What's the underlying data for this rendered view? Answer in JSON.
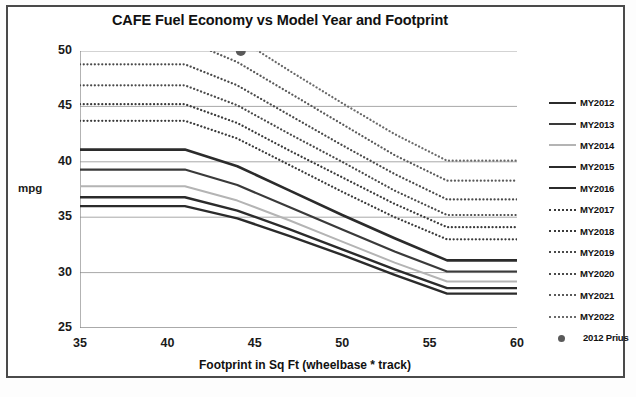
{
  "chart_data": {
    "type": "line",
    "title": "CAFE Fuel Economy vs Model Year and Footprint",
    "xlabel": "Footprint in Sq Ft (wheelbase * track)",
    "ylabel": "mpg",
    "xlim": [
      35,
      60
    ],
    "ylim": [
      25,
      50
    ],
    "xticks": [
      35,
      40,
      45,
      50,
      55,
      60
    ],
    "yticks": [
      25,
      30,
      35,
      40,
      45,
      50
    ],
    "grid": "horizontal",
    "legend_position": "right",
    "x": [
      35,
      41,
      44,
      47,
      50,
      53,
      56,
      60
    ],
    "series": [
      {
        "name": "MY2012",
        "style": "solid",
        "color": "#2b2b2b",
        "width": 2.6,
        "values": [
          41.1,
          41.1,
          39.6,
          37.4,
          35.2,
          33.1,
          31.1,
          31.1
        ]
      },
      {
        "name": "MY2013",
        "style": "solid",
        "color": "#3a3a3a",
        "width": 2.2,
        "values": [
          39.3,
          39.3,
          37.9,
          35.9,
          33.9,
          31.9,
          30.1,
          30.1
        ]
      },
      {
        "name": "MY2014",
        "style": "solid",
        "color": "#b4b4b4",
        "width": 2.0,
        "values": [
          37.8,
          37.8,
          36.5,
          34.7,
          32.8,
          30.9,
          29.2,
          29.2
        ]
      },
      {
        "name": "MY2015",
        "style": "solid",
        "color": "#2b2b2b",
        "width": 2.4,
        "values": [
          36.8,
          36.8,
          35.6,
          33.9,
          32.1,
          30.3,
          28.6,
          28.6
        ]
      },
      {
        "name": "MY2016",
        "style": "solid",
        "color": "#2b2b2b",
        "width": 2.4,
        "values": [
          36.0,
          36.0,
          34.9,
          33.3,
          31.6,
          29.8,
          28.1,
          28.1
        ]
      },
      {
        "name": "MY2017",
        "style": "dotted",
        "color": "#3a3a3a",
        "width": 2.2,
        "values": [
          43.7,
          43.7,
          42.1,
          39.7,
          37.3,
          35.0,
          33.0,
          33.0
        ]
      },
      {
        "name": "MY2018",
        "style": "dotted",
        "color": "#3a3a3a",
        "width": 2.2,
        "values": [
          45.2,
          45.2,
          43.5,
          41.0,
          38.6,
          36.2,
          34.1,
          34.1
        ]
      },
      {
        "name": "MY2019",
        "style": "dotted",
        "color": "#4a4a4a",
        "width": 2.2,
        "values": [
          46.9,
          46.9,
          45.1,
          42.5,
          40.0,
          37.4,
          35.2,
          35.2
        ]
      },
      {
        "name": "MY2020",
        "style": "dotted",
        "color": "#4a4a4a",
        "width": 2.2,
        "values": [
          48.8,
          48.8,
          46.9,
          44.2,
          41.5,
          38.9,
          36.6,
          36.6
        ]
      },
      {
        "name": "MY2021",
        "style": "dotted",
        "color": "#5a5a5a",
        "width": 2.2,
        "values": [
          51.0,
          51.0,
          49.0,
          46.2,
          43.4,
          40.6,
          38.3,
          38.3
        ]
      },
      {
        "name": "MY2022",
        "style": "dotted",
        "color": "#6a6a6a",
        "width": 2.2,
        "values": [
          53.2,
          53.2,
          51.2,
          48.2,
          45.3,
          42.5,
          40.1,
          40.1
        ]
      }
    ],
    "points": [
      {
        "name": "2012 Prius",
        "x": 44.2,
        "y": 50.0,
        "color": "#5a5a5a",
        "marker": "circle"
      }
    ]
  },
  "legend": {
    "items": [
      {
        "label": "MY2012",
        "style": "solid",
        "color": "#2b2b2b"
      },
      {
        "label": "MY2013",
        "style": "solid",
        "color": "#3a3a3a"
      },
      {
        "label": "MY2014",
        "style": "solid",
        "color": "#b4b4b4"
      },
      {
        "label": "MY2015",
        "style": "solid",
        "color": "#2b2b2b"
      },
      {
        "label": "MY2016",
        "style": "solid",
        "color": "#2b2b2b"
      },
      {
        "label": "MY2017",
        "style": "dotted",
        "color": "#3a3a3a"
      },
      {
        "label": "MY2018",
        "style": "dotted",
        "color": "#3a3a3a"
      },
      {
        "label": "MY2019",
        "style": "dotted",
        "color": "#4a4a4a"
      },
      {
        "label": "MY2020",
        "style": "dotted",
        "color": "#4a4a4a"
      },
      {
        "label": "MY2021",
        "style": "dotted",
        "color": "#5a5a5a"
      },
      {
        "label": "MY2022",
        "style": "dotted",
        "color": "#6a6a6a"
      }
    ],
    "marker_item": {
      "label": "2012 Prius",
      "color": "#5a5a5a"
    }
  },
  "colors": {
    "axis": "#808080",
    "grid": "#a8a8a8",
    "frame": "#4a4a4a",
    "text": "#111111"
  }
}
